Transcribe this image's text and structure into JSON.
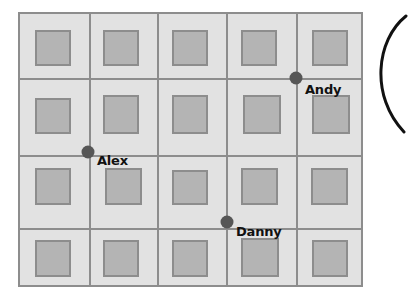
{
  "scene": {
    "type": "grid-map-diagram",
    "canvas": {
      "width": 385,
      "height": 304
    },
    "background_color": "#ffffff"
  },
  "map": {
    "name": "city-block-grid",
    "origin": {
      "x": 18,
      "y": 12
    },
    "size": {
      "width": 345,
      "height": 275
    },
    "cell_background_color": "#e2e2e2",
    "grid_line_color": "#8d8d8d",
    "border_color": "#8d8d8d",
    "columns": 5,
    "rows": 4,
    "vertical_line_x": [
      88,
      156,
      225,
      295
    ],
    "horizontal_line_y": [
      77,
      154,
      227
    ]
  },
  "blocks": {
    "fill_color": "#b4b4b4",
    "border_color": "#8d8d8d",
    "items": [
      {
        "row": 1,
        "col": 1,
        "x": 33,
        "y": 28,
        "w": 36,
        "h": 36
      },
      {
        "row": 1,
        "col": 2,
        "x": 101,
        "y": 28,
        "w": 36,
        "h": 36
      },
      {
        "row": 1,
        "col": 3,
        "x": 170,
        "y": 28,
        "w": 36,
        "h": 36
      },
      {
        "row": 1,
        "col": 4,
        "x": 239,
        "y": 28,
        "w": 36,
        "h": 36
      },
      {
        "row": 1,
        "col": 5,
        "x": 310,
        "y": 28,
        "w": 36,
        "h": 36
      },
      {
        "row": 2,
        "col": 1,
        "x": 33,
        "y": 96,
        "w": 36,
        "h": 36
      },
      {
        "row": 2,
        "col": 2,
        "x": 101,
        "y": 93,
        "w": 36,
        "h": 39
      },
      {
        "row": 2,
        "col": 3,
        "x": 170,
        "y": 93,
        "w": 36,
        "h": 39
      },
      {
        "row": 2,
        "col": 4,
        "x": 241,
        "y": 93,
        "w": 38,
        "h": 39
      },
      {
        "row": 2,
        "col": 5,
        "x": 310,
        "y": 93,
        "w": 38,
        "h": 39
      },
      {
        "row": 3,
        "col": 1,
        "x": 33,
        "y": 166,
        "w": 36,
        "h": 37
      },
      {
        "row": 3,
        "col": 2,
        "x": 103,
        "y": 166,
        "w": 37,
        "h": 37
      },
      {
        "row": 3,
        "col": 3,
        "x": 170,
        "y": 168,
        "w": 36,
        "h": 35
      },
      {
        "row": 3,
        "col": 4,
        "x": 239,
        "y": 166,
        "w": 37,
        "h": 37
      },
      {
        "row": 3,
        "col": 5,
        "x": 309,
        "y": 166,
        "w": 37,
        "h": 37
      },
      {
        "row": 4,
        "col": 1,
        "x": 33,
        "y": 238,
        "w": 36,
        "h": 37
      },
      {
        "row": 4,
        "col": 2,
        "x": 101,
        "y": 238,
        "w": 36,
        "h": 37
      },
      {
        "row": 4,
        "col": 3,
        "x": 170,
        "y": 238,
        "w": 36,
        "h": 37
      },
      {
        "row": 4,
        "col": 4,
        "x": 239,
        "y": 236,
        "w": 38,
        "h": 39
      },
      {
        "row": 4,
        "col": 5,
        "x": 310,
        "y": 238,
        "w": 36,
        "h": 37
      }
    ]
  },
  "people": {
    "marker_color": "#565656",
    "label_color": "#111111",
    "items": [
      {
        "id": "andy",
        "label": "Andy",
        "marker": {
          "x": 296,
          "y": 78
        },
        "label_pos": {
          "x": 305,
          "y": 89
        }
      },
      {
        "id": "alex",
        "label": "Alex",
        "marker": {
          "x": 88,
          "y": 152
        },
        "label_pos": {
          "x": 97,
          "y": 160
        }
      },
      {
        "id": "danny",
        "label": "Danny",
        "marker": {
          "x": 227,
          "y": 222
        },
        "label_pos": {
          "x": 236,
          "y": 231
        }
      }
    ]
  },
  "arc": {
    "name": "circle-edge-arc",
    "color": "#111111",
    "stroke_width": 3,
    "description": "left edge of a large circle cropped by the right image border"
  }
}
